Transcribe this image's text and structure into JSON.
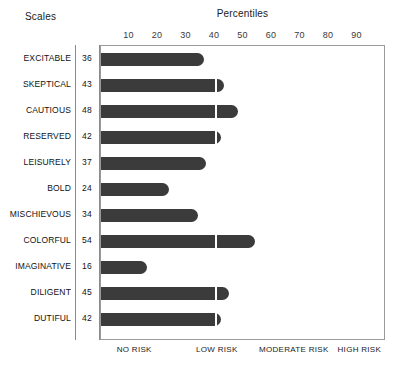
{
  "header": {
    "scales_label": "Scales",
    "title": "Percentiles"
  },
  "chart_data": {
    "type": "bar",
    "orientation": "horizontal",
    "title": "Percentiles",
    "xlabel": "Percentiles",
    "ylabel": "Scales",
    "xlim": [
      0,
      100
    ],
    "grid": false,
    "gridline_at": 40,
    "bar_color": "#3b3b3b",
    "categories": [
      "EXCITABLE",
      "SKEPTICAL",
      "CAUTIOUS",
      "RESERVED",
      "LEISURELY",
      "BOLD",
      "MISCHIEVOUS",
      "COLORFUL",
      "IMAGINATIVE",
      "DILIGENT",
      "DUTIFUL"
    ],
    "values": [
      36,
      43,
      48,
      42,
      37,
      24,
      34,
      54,
      16,
      45,
      42
    ],
    "xticks": [
      10,
      20,
      30,
      40,
      50,
      60,
      70,
      80,
      90
    ],
    "xtick_labels": [
      "10",
      "20",
      "30",
      "40",
      "50",
      "60",
      "70",
      "80",
      "90"
    ],
    "risk_bands": [
      {
        "label": "NO RISK",
        "center": 12
      },
      {
        "label": "LOW RISK",
        "center": 41
      },
      {
        "label": "MODERATE RISK",
        "center": 68
      },
      {
        "label": "HIGH RISK",
        "center": 91
      }
    ]
  }
}
